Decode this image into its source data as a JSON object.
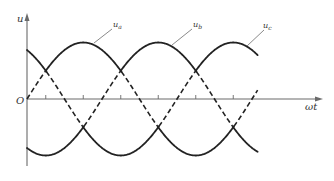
{
  "figure": {
    "y_axis_label": "u",
    "x_axis_label": "ωt",
    "origin_label": "O",
    "curve_labels": [
      {
        "base": "u",
        "sub": "a"
      },
      {
        "base": "u",
        "sub": "b"
      },
      {
        "base": "u",
        "sub": "c"
      }
    ]
  },
  "chart_data": {
    "type": "line",
    "title": "",
    "xlabel": "ωt",
    "ylabel": "u",
    "series": [
      {
        "name": "u_a",
        "function": "sin(ωt)",
        "phase_deg": 0
      },
      {
        "name": "u_b",
        "function": "sin(ωt - 120°)",
        "phase_deg": -120
      },
      {
        "name": "u_c",
        "function": "sin(ωt + 120°)",
        "phase_deg": 120
      }
    ],
    "x_range_deg": [
      0,
      420
    ],
    "amplitude": 1,
    "x_ticks_deg": [
      30,
      90,
      150,
      210,
      270,
      330
    ],
    "grid": false,
    "legend": "inline leader-line labels"
  },
  "colors": {
    "curve": "#222222",
    "axis": "#6a6a6a",
    "leader": "#8a8a8a"
  }
}
